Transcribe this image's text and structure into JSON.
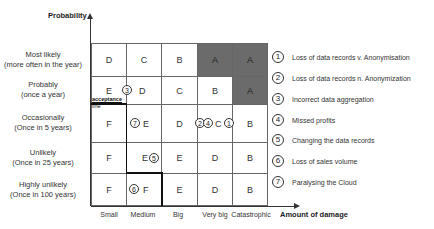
{
  "y_axis": {
    "title": "Probability",
    "levels": [
      {
        "line1": "Most likely",
        "line2": "(more often in the year)"
      },
      {
        "line1": "Probably",
        "line2": "(once a year)"
      },
      {
        "line1": "Occasionally",
        "line2": "(Once in 5 years)"
      },
      {
        "line1": "Unlikely",
        "line2": "(Once in 25 years)"
      },
      {
        "line1": "Highly unlikely",
        "line2": "(Once in 100 years)"
      }
    ]
  },
  "x_axis": {
    "title": "Amount of damage",
    "levels": [
      "Small",
      "Medium",
      "Big",
      "Very big",
      "Catastrophic"
    ]
  },
  "matrix": {
    "rows": [
      [
        "D",
        "C",
        "B",
        "A",
        "A"
      ],
      [
        "E",
        "D",
        "C",
        "B",
        "A"
      ],
      [
        "F",
        "E",
        "D",
        "C",
        "B"
      ],
      [
        "F",
        "E",
        "E",
        "D",
        "B"
      ],
      [
        "F",
        "F",
        "E",
        "D",
        "B"
      ]
    ],
    "dark_cells": [
      [
        0,
        3
      ],
      [
        0,
        4
      ],
      [
        1,
        4
      ]
    ],
    "dark_color": "#6b6b6b",
    "acceptance_line_label_1": "acceptance",
    "acceptance_line_label_2": "line"
  },
  "markers": {
    "m1": "1",
    "m2": "2",
    "m3": "3",
    "m4": "4",
    "m5": "5",
    "m6": "6",
    "m7": "7"
  },
  "legend": [
    {
      "num": "1",
      "label": "Loss of data records v. Anonymisation"
    },
    {
      "num": "2",
      "label": "Loss of data records n. Anonymization"
    },
    {
      "num": "3",
      "label": "Incorrect data aggregation"
    },
    {
      "num": "4",
      "label": "Missed profits"
    },
    {
      "num": "5",
      "label": "Changing the data records"
    },
    {
      "num": "6",
      "label": "Loss of sales volume"
    },
    {
      "num": "7",
      "label": "Paralysing the Cloud"
    }
  ]
}
